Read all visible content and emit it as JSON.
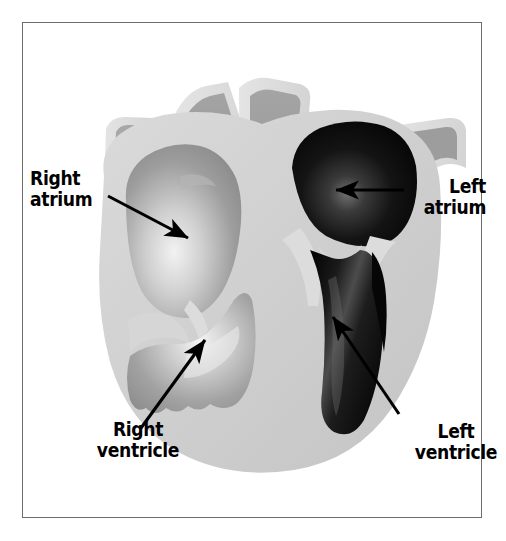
{
  "figure": {
    "kind": "anatomical-illustration",
    "frame_border_color": "#6d6d6d",
    "background_color": "#ffffff"
  },
  "labels": [
    {
      "id": "right-atrium",
      "text": "Right\natrium",
      "line1": "Right",
      "line2": "atrium",
      "align": "left",
      "arrow_from": [
        148,
        196
      ],
      "arrow_to": [
        191,
        240
      ]
    },
    {
      "id": "left-atrium",
      "text": "Left\natrium",
      "line1": "Left",
      "line2": "atrium",
      "align": "right",
      "arrow_from": [
        400,
        190
      ],
      "arrow_to": [
        333,
        190
      ]
    },
    {
      "id": "right-ventricle",
      "text": "Right\nventricle",
      "line1": "Right",
      "line2": "ventricle",
      "align": "center",
      "arrow_from": [
        143,
        426
      ],
      "arrow_to": [
        207,
        337
      ]
    },
    {
      "id": "left-ventricle",
      "text": "Left\nventricle",
      "line1": "Left",
      "line2": "ventricle",
      "align": "center",
      "arrow_from": [
        395,
        410
      ],
      "arrow_to": [
        330,
        313
      ]
    }
  ],
  "palette": {
    "myocardium_light": "#d2d2d2",
    "myocardium_mid": "#c3c3c3",
    "vessel_wall": "#dcdcdc",
    "vessel_lumen": "#9a9a9a",
    "right_chamber_dark": "#8e8e8e",
    "right_chamber_light": "#f0f0f0",
    "left_chamber_dark": "#0a0a0a",
    "left_chamber_highlight": "#5a5a5a",
    "arrow_color": "#000000",
    "text_color": "#000000"
  },
  "structures": [
    {
      "name": "superior-vena-cava",
      "side": "right-heart",
      "fill": "vessel_lumen"
    },
    {
      "name": "pulmonary-artery",
      "side": "right-heart",
      "fill": "vessel_lumen"
    },
    {
      "name": "aorta",
      "side": "left-heart",
      "fill": "vessel_lumen"
    },
    {
      "name": "pulmonary-vein",
      "side": "left-heart",
      "fill": "vessel_lumen"
    },
    {
      "name": "right-atrium-chamber",
      "side": "right-heart",
      "fill": "right_chamber_light"
    },
    {
      "name": "right-ventricle-chamber",
      "side": "right-heart",
      "fill": "right_chamber_light"
    },
    {
      "name": "left-atrium-chamber",
      "side": "left-heart",
      "fill": "left_chamber_dark"
    },
    {
      "name": "left-ventricle-chamber",
      "side": "left-heart",
      "fill": "left_chamber_dark"
    },
    {
      "name": "tricuspid-valve",
      "side": "right-heart",
      "fill": "myocardium_light"
    },
    {
      "name": "mitral-valve",
      "side": "left-heart",
      "fill": "myocardium_light"
    },
    {
      "name": "interventricular-septum",
      "side": "both",
      "fill": "myocardium_light"
    }
  ]
}
